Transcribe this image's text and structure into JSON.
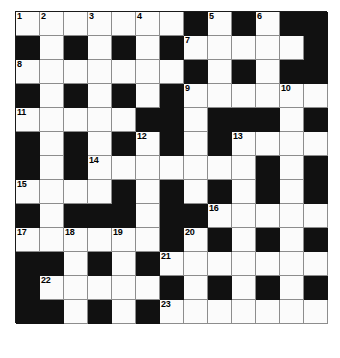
{
  "puzzle": {
    "type": "crossword-grid",
    "rows": 13,
    "cols": 13,
    "cell_size_px": 24,
    "colors": {
      "block": "#111111",
      "open": "#fbfbfb",
      "grid_line": "#8d8d8d",
      "number_text": "#000000",
      "page_background": "#ffffff"
    },
    "legend": {
      "1": "open cell",
      "0": "blocked cell"
    },
    "grid": [
      [
        1,
        1,
        1,
        1,
        1,
        1,
        1,
        0,
        1,
        0,
        1,
        0,
        0
      ],
      [
        0,
        1,
        0,
        1,
        0,
        1,
        0,
        1,
        1,
        1,
        1,
        1,
        0
      ],
      [
        1,
        1,
        1,
        1,
        1,
        1,
        1,
        0,
        1,
        0,
        1,
        0,
        0
      ],
      [
        0,
        1,
        0,
        1,
        0,
        1,
        0,
        1,
        1,
        1,
        1,
        1,
        1
      ],
      [
        1,
        1,
        1,
        1,
        1,
        0,
        0,
        1,
        0,
        0,
        0,
        1,
        0
      ],
      [
        0,
        1,
        0,
        1,
        0,
        1,
        0,
        1,
        0,
        1,
        1,
        1,
        1
      ],
      [
        0,
        1,
        0,
        1,
        1,
        1,
        1,
        1,
        1,
        1,
        0,
        1,
        0
      ],
      [
        1,
        1,
        1,
        1,
        0,
        1,
        0,
        1,
        0,
        1,
        0,
        1,
        0
      ],
      [
        0,
        1,
        0,
        0,
        0,
        1,
        0,
        0,
        1,
        1,
        1,
        1,
        1
      ],
      [
        1,
        1,
        1,
        1,
        1,
        1,
        0,
        1,
        0,
        1,
        0,
        1,
        0
      ],
      [
        0,
        0,
        1,
        0,
        1,
        0,
        1,
        1,
        1,
        1,
        1,
        1,
        1
      ],
      [
        0,
        1,
        1,
        1,
        1,
        1,
        0,
        1,
        0,
        1,
        0,
        1,
        0
      ],
      [
        0,
        0,
        1,
        0,
        1,
        0,
        1,
        1,
        1,
        1,
        1,
        1,
        1
      ]
    ],
    "numbers": [
      {
        "label": "1",
        "row": 0,
        "col": 0
      },
      {
        "label": "2",
        "row": 0,
        "col": 1
      },
      {
        "label": "3",
        "row": 0,
        "col": 3
      },
      {
        "label": "4",
        "row": 0,
        "col": 5
      },
      {
        "label": "5",
        "row": 0,
        "col": 8
      },
      {
        "label": "6",
        "row": 0,
        "col": 10
      },
      {
        "label": "7",
        "row": 1,
        "col": 7
      },
      {
        "label": "8",
        "row": 2,
        "col": 0
      },
      {
        "label": "9",
        "row": 3,
        "col": 7
      },
      {
        "label": "10",
        "row": 3,
        "col": 11
      },
      {
        "label": "11",
        "row": 4,
        "col": 0
      },
      {
        "label": "12",
        "row": 5,
        "col": 5
      },
      {
        "label": "13",
        "row": 5,
        "col": 9
      },
      {
        "label": "14",
        "row": 6,
        "col": 3
      },
      {
        "label": "15",
        "row": 7,
        "col": 0
      },
      {
        "label": "16",
        "row": 8,
        "col": 8
      },
      {
        "label": "17",
        "row": 9,
        "col": 0
      },
      {
        "label": "18",
        "row": 9,
        "col": 2
      },
      {
        "label": "19",
        "row": 9,
        "col": 4
      },
      {
        "label": "20",
        "row": 9,
        "col": 7
      },
      {
        "label": "21",
        "row": 10,
        "col": 6
      },
      {
        "label": "22",
        "row": 11,
        "col": 1
      },
      {
        "label": "23",
        "row": 12,
        "col": 6
      }
    ]
  }
}
